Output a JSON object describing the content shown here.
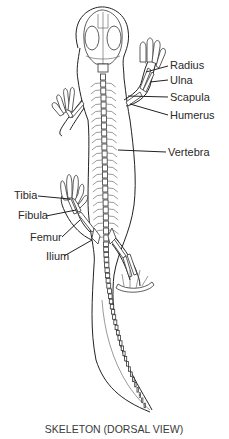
{
  "figure": {
    "caption": "SKELETON (DORSAL VIEW)",
    "labels": {
      "radius": "Radius",
      "ulna": "Ulna",
      "scapula": "Scapula",
      "humerus": "Humerus",
      "vertebra": "Vertebra",
      "tibia": "Tibia",
      "fibula": "Fibula",
      "femur": "Femur",
      "ilium": "Ilium"
    }
  }
}
